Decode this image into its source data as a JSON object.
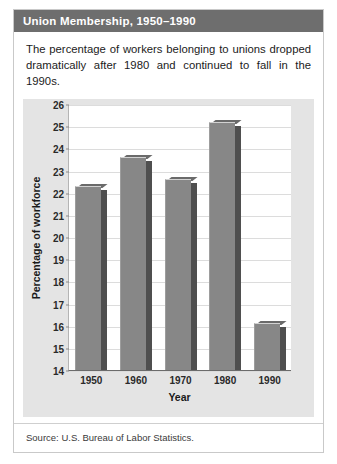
{
  "card": {
    "header_title": "Union Membership, 1950–1990",
    "description": "The percentage of workers belonging to unions dropped dramatically after 1980 and continued to fall in the 1990s.",
    "source": "Source: U.S. Bureau of Labor Statistics."
  },
  "colors": {
    "header_background": "#6e6e6e",
    "header_text": "#ffffff",
    "chart_panel_background": "#e4e4e4",
    "plot_background": "#ffffff",
    "bar_fill": "#878787",
    "bar_shadow": "#4f4f4f",
    "gridline": "#dcdcdc",
    "axis_line": "#6b6b6b"
  },
  "chart_data": {
    "type": "bar",
    "title": "Union Membership, 1950–1990",
    "xlabel": "Year",
    "ylabel": "Percentage of workforce",
    "categories": [
      "1950",
      "1960",
      "1970",
      "1980",
      "1990"
    ],
    "values": [
      22.3,
      23.6,
      22.6,
      25.2,
      16.1
    ],
    "ylim": [
      14,
      26
    ],
    "ytick_values": [
      14,
      15,
      16,
      17,
      18,
      19,
      20,
      21,
      22,
      23,
      24,
      25,
      26
    ],
    "ytick_labels": [
      "14",
      "15",
      "16",
      "17",
      "18",
      "19",
      "20",
      "21",
      "22",
      "23",
      "24",
      "25",
      "26"
    ],
    "grid": true,
    "legend": false
  }
}
